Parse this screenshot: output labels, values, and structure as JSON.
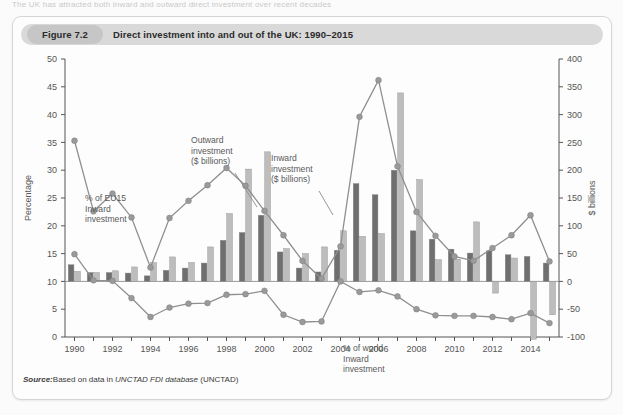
{
  "page": {
    "cut_top_text": "The UK has attracted both inward and outward direct investment over recent decades"
  },
  "figure": {
    "number_label": "Figure 7.2",
    "title": "Direct investment into and out of the UK: 1990–2015",
    "source_lead": "Source:",
    "source_text_1": "Based on data in ",
    "source_italic": "UNCTAD FDI database",
    "source_text_2": " (UNCTAD)"
  },
  "colors": {
    "inward_bar": "#6f6f6f",
    "outward_bar": "#bdbdbd",
    "line": "#8f8f8f",
    "marker": "#9a9a9a",
    "axis": "#555555",
    "card_header": "#d9d9d9",
    "page_bg": "#fbfbfb"
  },
  "chart_data": {
    "type": "bar",
    "title": "Direct investment into and out of the UK: 1990–2015",
    "xlabel": "",
    "ylabel": "Percentage",
    "y2label": "$ billions",
    "ylim": [
      0,
      50
    ],
    "y2lim": [
      -100,
      400
    ],
    "yticks": [
      0,
      5,
      10,
      15,
      20,
      25,
      30,
      35,
      40,
      45,
      50
    ],
    "y2ticks": [
      -100,
      -50,
      0,
      50,
      100,
      150,
      200,
      250,
      300,
      350,
      400
    ],
    "grid": false,
    "legend_position": "annotations",
    "categories": [
      1990,
      1991,
      1992,
      1993,
      1994,
      1995,
      1996,
      1997,
      1998,
      1999,
      2000,
      2001,
      2002,
      2003,
      2004,
      2005,
      2006,
      2007,
      2008,
      2009,
      2010,
      2011,
      2012,
      2013,
      2014,
      2015
    ],
    "xtick_labels": [
      "1990",
      "1992",
      "1994",
      "1996",
      "1998",
      "2000",
      "2002",
      "2004",
      "2006",
      "2008",
      "2010",
      "2012",
      "2014"
    ],
    "series": [
      {
        "name": "Inward investment ($ billions)",
        "type": "bar",
        "axis": "right",
        "units": "$ billions",
        "values": [
          30,
          16,
          16,
          15,
          10,
          20,
          24,
          33,
          74,
          88,
          119,
          53,
          24,
          17,
          56,
          176,
          156,
          200,
          91,
          76,
          58,
          51,
          55,
          48,
          45,
          33
        ]
      },
      {
        "name": "Outward investment ($ billions)",
        "type": "bar",
        "axis": "right",
        "units": "$ billions",
        "values": [
          18,
          16,
          19,
          26,
          34,
          44,
          34,
          62,
          122,
          202,
          233,
          59,
          50,
          62,
          91,
          81,
          86,
          339,
          183,
          39,
          40,
          107,
          -21,
          42,
          -104,
          -60
        ]
      },
      {
        "name": "% of EU15 Inward investment",
        "type": "line",
        "axis": "left",
        "units": "percentage",
        "values": [
          35.3,
          22.6,
          25.8,
          21.5,
          12.5,
          21.4,
          24.5,
          27.3,
          30.4,
          27.2,
          22.7,
          18.3,
          13.7,
          10.5,
          16.3,
          39.6,
          46.2,
          30.7,
          22.5,
          18.2,
          14.5,
          13.7,
          16.0,
          18.3,
          21.9,
          13.6
        ]
      },
      {
        "name": "% of world Inward investment",
        "type": "line",
        "axis": "left",
        "units": "percentage",
        "values": [
          14.9,
          10.2,
          10.1,
          7.0,
          3.6,
          5.3,
          6.0,
          6.1,
          7.6,
          7.7,
          8.3,
          4.0,
          2.7,
          2.8,
          10.0,
          8.1,
          8.4,
          7.3,
          5.0,
          3.9,
          3.8,
          3.8,
          3.6,
          3.2,
          4.3,
          2.5
        ]
      }
    ],
    "annotations": [
      {
        "id": "outward",
        "text_lines": [
          "Outward",
          "investment",
          "($ billions)"
        ]
      },
      {
        "id": "inward",
        "text_lines": [
          "Inward",
          "investment",
          "($ billions)"
        ]
      },
      {
        "id": "eu15",
        "text_lines": [
          "% of EU15",
          "Inward",
          "investment"
        ]
      },
      {
        "id": "world",
        "text_lines": [
          "% of world",
          "Inward",
          "investment"
        ]
      }
    ]
  }
}
